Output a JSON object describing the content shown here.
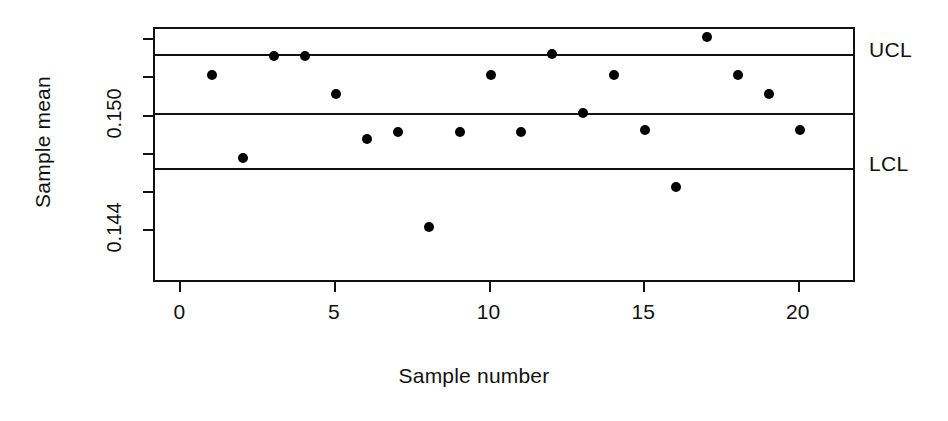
{
  "chart_data": {
    "type": "scatter",
    "title": "",
    "xlabel": "Sample number",
    "ylabel": "Sample mean",
    "x": [
      1,
      2,
      3,
      4,
      5,
      6,
      7,
      8,
      9,
      10,
      11,
      12,
      13,
      14,
      15,
      16,
      17,
      18,
      19,
      20
    ],
    "values": [
      0.1522,
      0.1478,
      0.1532,
      0.1532,
      0.1512,
      0.1488,
      0.1492,
      0.1442,
      0.1492,
      0.1522,
      0.1492,
      0.1533,
      0.1502,
      0.1522,
      0.1493,
      0.1463,
      0.1542,
      0.1522,
      0.1512,
      0.1493
    ],
    "xlim": [
      -0.85,
      21.85
    ],
    "ylim": [
      0.1412,
      0.1546
    ],
    "xticks": [
      0,
      5,
      10,
      15,
      20
    ],
    "xticklabels": [
      "0",
      "5",
      "10",
      "15",
      "20"
    ],
    "yticks": [
      0.144,
      0.146,
      0.148,
      0.15,
      0.152,
      0.154
    ],
    "yticklabels": [
      "0.144",
      "",
      "",
      "0.150",
      "",
      ""
    ],
    "grid": false,
    "legend": false,
    "control_lines": [
      {
        "name": "UCL",
        "label": "UCL",
        "value": 0.1533
      },
      {
        "name": "center",
        "label": "",
        "value": 0.1502
      },
      {
        "name": "LCL",
        "label": "LCL",
        "value": 0.1473
      }
    ],
    "marker": "filled-circle",
    "marker_color": "#000000",
    "line_color": "#111111"
  },
  "axes": {
    "y_title": "Sample mean",
    "x_title": "Sample number",
    "y_tick_labels": [
      {
        "text": "0.150",
        "value": 0.15
      },
      {
        "text": "0.144",
        "value": 0.144
      }
    ],
    "x_tick_labels": [
      {
        "text": "0",
        "value": 0
      },
      {
        "text": "5",
        "value": 5
      },
      {
        "text": "10",
        "value": 10
      },
      {
        "text": "15",
        "value": 15
      },
      {
        "text": "20",
        "value": 20
      }
    ]
  },
  "annotations": {
    "ucl": "UCL",
    "lcl": "LCL"
  },
  "colors": {
    "ink": "#111111",
    "marker": "#000000",
    "background": "#ffffff"
  }
}
